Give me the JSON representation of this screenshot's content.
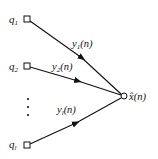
{
  "diagram": {
    "type": "signal-flow-graph",
    "inputs": [
      {
        "symbol": "q",
        "subscript": "1",
        "edge_label": {
          "symbol": "y",
          "subscript": "1",
          "arg": "(n)"
        }
      },
      {
        "symbol": "q",
        "subscript": "2",
        "edge_label": {
          "symbol": "y",
          "subscript": "2",
          "arg": "(n)"
        }
      },
      {
        "symbol": "q",
        "subscript": "l",
        "edge_label": {
          "symbol": "y",
          "subscript": "l",
          "arg": "(n)"
        }
      }
    ],
    "ellipsis": "⋮",
    "output": {
      "symbol": "x̂",
      "arg": "(n)"
    },
    "colors": {
      "stroke": "#111111",
      "background": "#ffffff"
    }
  }
}
